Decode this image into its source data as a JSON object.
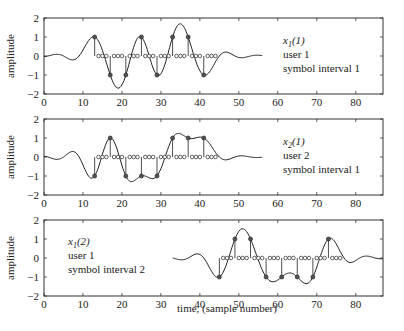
{
  "figure": {
    "xlabel": "time, (sample number)",
    "ylabel": "amplitude"
  },
  "chart_data": [
    {
      "type": "line",
      "panel": 1,
      "title": "",
      "xlabel": "",
      "ylabel": "amplitude",
      "xlim": [
        0,
        87
      ],
      "ylim": [
        -2,
        2
      ],
      "xticks": [
        0,
        10,
        20,
        30,
        40,
        50,
        60,
        70,
        80
      ],
      "yticks": [
        -2,
        -1,
        0,
        1,
        2
      ],
      "grid": false,
      "annotation": {
        "symbol": "x",
        "subscript": "1",
        "arg": "(1)",
        "line2": "user 1",
        "line3": "symbol interval 1"
      },
      "signal_range": [
        0,
        56
      ],
      "symbol_samples": [
        13,
        17,
        21,
        25,
        29,
        33,
        37,
        41
      ],
      "symbol_values": [
        1,
        -1,
        -1,
        1,
        -1,
        1,
        1,
        -1
      ],
      "zero_samples": [
        14,
        15,
        16,
        18,
        19,
        20,
        22,
        23,
        24,
        26,
        27,
        28,
        30,
        31,
        32,
        34,
        35,
        36,
        38,
        39,
        40,
        42,
        43,
        44
      ]
    },
    {
      "type": "line",
      "panel": 2,
      "title": "",
      "xlabel": "",
      "ylabel": "amplitude",
      "xlim": [
        0,
        87
      ],
      "ylim": [
        -2,
        2
      ],
      "xticks": [
        0,
        10,
        20,
        30,
        40,
        50,
        60,
        70,
        80
      ],
      "yticks": [
        -2,
        -1,
        0,
        1,
        2
      ],
      "grid": false,
      "annotation": {
        "symbol": "x",
        "subscript": "2",
        "arg": "(1)",
        "line2": "user 2",
        "line3": "symbol interval 1"
      },
      "signal_range": [
        0,
        56
      ],
      "symbol_samples": [
        13,
        17,
        21,
        25,
        29,
        33,
        37,
        41
      ],
      "symbol_values": [
        -1,
        1,
        -1,
        -1,
        -1,
        1,
        1,
        1
      ],
      "zero_samples": [
        14,
        15,
        16,
        18,
        19,
        20,
        22,
        23,
        24,
        26,
        27,
        28,
        30,
        31,
        32,
        34,
        35,
        36,
        38,
        39,
        40,
        42,
        43,
        44
      ]
    },
    {
      "type": "line",
      "panel": 3,
      "title": "",
      "xlabel": "time, (sample number)",
      "ylabel": "amplitude",
      "xlim": [
        0,
        87
      ],
      "ylim": [
        -2,
        2
      ],
      "xticks": [
        0,
        10,
        20,
        30,
        40,
        50,
        60,
        70,
        80
      ],
      "yticks": [
        -2,
        -1,
        0,
        1,
        2
      ],
      "grid": false,
      "annotation": {
        "symbol": "x",
        "subscript": "1",
        "arg": "(2)",
        "line2": "user 1",
        "line3": "symbol interval 2"
      },
      "signal_range": [
        33,
        87
      ],
      "symbol_samples": [
        45,
        49,
        53,
        57,
        61,
        65,
        69,
        73
      ],
      "symbol_values": [
        -1,
        1,
        1,
        -1,
        -1,
        -1,
        -1,
        1
      ],
      "zero_samples": [
        46,
        47,
        48,
        50,
        51,
        52,
        54,
        55,
        56,
        58,
        59,
        60,
        62,
        63,
        64,
        66,
        67,
        68,
        70,
        71,
        72,
        74,
        75,
        76
      ]
    }
  ]
}
